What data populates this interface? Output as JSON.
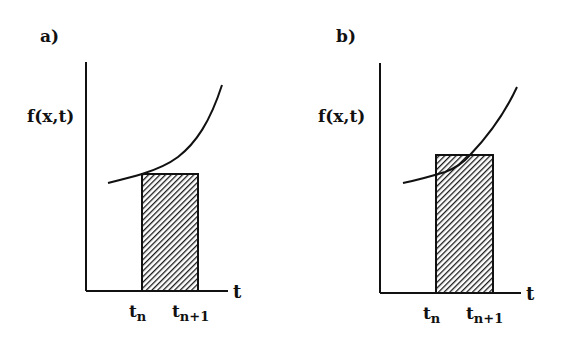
{
  "panels": [
    {
      "id": "a",
      "label": "a)",
      "y_axis_label": "f(x,t)",
      "x_axis_label": "t",
      "tick_left": "t",
      "tick_left_sub": "n",
      "tick_right": "t",
      "tick_right_sub": "n+1",
      "description": "Rectangle height equals f at left endpoint t_n (below curve)"
    },
    {
      "id": "b",
      "label": "b)",
      "y_axis_label": "f(x,t)",
      "x_axis_label": "t",
      "tick_left": "t",
      "tick_left_sub": "n",
      "tick_right": "t",
      "tick_right_sub": "n+1",
      "description": "Rectangle height equals f at an intermediate point; curve crosses rectangle top"
    }
  ],
  "colors": {
    "ink": "#111111",
    "background": "#ffffff"
  }
}
